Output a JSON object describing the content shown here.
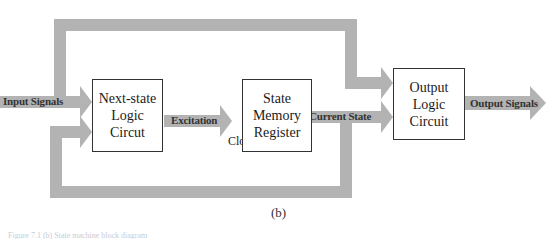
{
  "diagram": {
    "type": "block-diagram",
    "arrow_color": "#b3b3b3",
    "blocks": [
      {
        "id": "next_state",
        "lines": [
          "Next-state",
          "Logic",
          "Circut"
        ]
      },
      {
        "id": "state_memory",
        "lines": [
          "State",
          "Memory",
          "Register"
        ]
      },
      {
        "id": "output_logic",
        "lines": [
          "Output",
          "Logic",
          "Circuit"
        ]
      }
    ],
    "signals": {
      "input": "Input Signals",
      "excitation": "Excitation",
      "current_state": "Current State",
      "output": "Output Signals"
    },
    "clock_label": "Clock",
    "connections": [
      {
        "from": "Input Signals",
        "to": "next_state"
      },
      {
        "from": "next_state",
        "to": "state_memory",
        "label": "Excitation"
      },
      {
        "from": "Clock",
        "to": "state_memory"
      },
      {
        "from": "state_memory",
        "to": "output_logic",
        "label": "Current State"
      },
      {
        "from": "state_memory",
        "to": "next_state",
        "type": "feedback"
      },
      {
        "from": "Input Signals",
        "to": "output_logic",
        "type": "bypass"
      },
      {
        "from": "output_logic",
        "to": "Output Signals"
      }
    ]
  },
  "sublabel": "(b)",
  "caption": "Figure 7.1 (b) State machine block diagram"
}
